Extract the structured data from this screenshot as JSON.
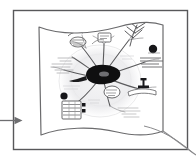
{
  "canvas": {
    "width": 196,
    "height": 161,
    "background_color": "#ffffff"
  },
  "frame": {
    "label": "slide-frame",
    "x": 13,
    "y": 10,
    "width": 175,
    "height": 140,
    "stroke_color": "#58585a",
    "stroke_width": 1.4,
    "fill_color": "#ffffff"
  },
  "incoming_arrow": {
    "label": "incoming-flow-arrow",
    "direction": "right",
    "start_x": 0,
    "start_y": 120,
    "end_x": 22,
    "end_y": 120,
    "stroke_color": "#6e6e70",
    "stroke_width": 1.3
  },
  "outgoing_curve": {
    "label": "outgoing-flow-curve",
    "description": "curve sweeping from banner lower-right corner down past the frame corner",
    "stroke_color": "#8a8a8c",
    "stroke_width": 1.1
  },
  "banner": {
    "label": "wavy-banner",
    "description": "hand-drawn waving flag / banner panel holding the sketch",
    "stroke_color": "#6b6b6d",
    "stroke_width": 1.2,
    "fill_color": "#ffffff",
    "x": 39,
    "y": 24,
    "width": 125,
    "height": 112
  },
  "sketch": {
    "label": "mind-map-sketch",
    "description": "grey pencil mind map drawing with central dark blob, radiating branches, note blocks and scribbled text",
    "ink_color": "#4a4a4c",
    "light_ink_color": "#b9b9bb",
    "halo_color": "#e2e2e4",
    "center_blob_color": "#0f0f10",
    "accent_dot_color": "#17171a",
    "nodes": [
      {
        "name": "center-blob",
        "x": 104,
        "y": 74,
        "shape": "ink-blob"
      },
      {
        "name": "halo-ellipse",
        "x": 100,
        "y": 80,
        "shape": "ellipse"
      },
      {
        "name": "branch-top-left",
        "x": 78,
        "y": 42,
        "shape": "cluster"
      },
      {
        "name": "branch-top-mid",
        "x": 103,
        "y": 40,
        "shape": "cluster"
      },
      {
        "name": "branch-top-right",
        "x": 133,
        "y": 34,
        "shape": "tree"
      },
      {
        "name": "branch-right",
        "x": 150,
        "y": 58,
        "shape": "note-lines"
      },
      {
        "name": "dot-right",
        "x": 153,
        "y": 50,
        "shape": "dot"
      },
      {
        "name": "icon-anvil",
        "x": 143,
        "y": 85,
        "shape": "anvil"
      },
      {
        "name": "branch-lower-mid",
        "x": 112,
        "y": 92,
        "shape": "cluster"
      },
      {
        "name": "list-block",
        "x": 72,
        "y": 108,
        "shape": "ruled-list"
      },
      {
        "name": "dot-left",
        "x": 65,
        "y": 96,
        "shape": "dot"
      },
      {
        "name": "branch-left",
        "x": 62,
        "y": 68,
        "shape": "scribble-text"
      },
      {
        "name": "branch-lower-right",
        "x": 128,
        "y": 110,
        "shape": "scribble-text"
      }
    ]
  }
}
